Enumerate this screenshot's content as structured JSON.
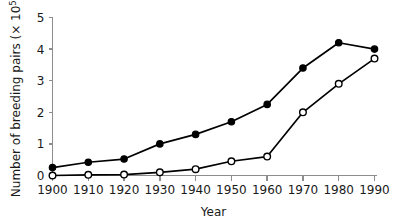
{
  "chart_data": {
    "type": "line",
    "title": "",
    "xlabel": "Year",
    "ylabel": "Number of breeding pairs (× 10",
    "ylabel_exponent": "5",
    "ylabel_close": ")",
    "categories": [
      1900,
      1910,
      1920,
      1930,
      1940,
      1950,
      1960,
      1970,
      1980,
      1990
    ],
    "x": [
      1900,
      1910,
      1920,
      1930,
      1940,
      1950,
      1960,
      1970,
      1980,
      1990
    ],
    "xtick_labels": [
      "1900",
      "1910",
      "1920",
      "1930",
      "1940",
      "1950",
      "1960",
      "1970",
      "1980",
      "1990"
    ],
    "ytick_labels": [
      "0",
      "1",
      "2",
      "3",
      "4",
      "5"
    ],
    "ytick_values": [
      0,
      1,
      2,
      3,
      4,
      5
    ],
    "xlim": [
      1900,
      1990
    ],
    "ylim": [
      0,
      5
    ],
    "grid": false,
    "legend": false,
    "legend_position": "none",
    "series": [
      {
        "name": "filled-circles",
        "marker": "filled-circle",
        "color": "#000000",
        "values": [
          0.25,
          0.42,
          0.52,
          1.0,
          1.3,
          1.7,
          2.25,
          3.4,
          4.2,
          4.0
        ]
      },
      {
        "name": "open-circles",
        "marker": "open-circle",
        "color": "#000000",
        "values": [
          0.0,
          0.02,
          0.03,
          0.1,
          0.2,
          0.45,
          0.6,
          2.0,
          2.9,
          3.7
        ]
      }
    ],
    "annotations": []
  },
  "axes": {
    "x_title": "Year",
    "y_title_text": "Number of breeding pairs (× 10",
    "y_title_sup": "5",
    "y_title_tail": ")"
  },
  "colors": {
    "background": "#ffffff",
    "ink": "#000000",
    "spine": "#8d8d8d",
    "text": "#1a1a1a"
  }
}
